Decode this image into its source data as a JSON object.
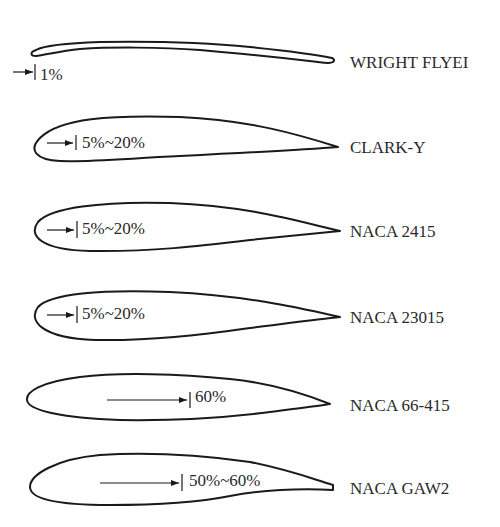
{
  "diagram": {
    "title": "",
    "airfoils": [
      {
        "name": "WRIGHT FLYEI",
        "max_thickness_position": "1%"
      },
      {
        "name": "CLARK-Y",
        "max_thickness_position": "5%~20%"
      },
      {
        "name": "NACA 2415",
        "max_thickness_position": "5%~20%"
      },
      {
        "name": "NACA 23015",
        "max_thickness_position": "5%~20%"
      },
      {
        "name": "NACA 66-415",
        "max_thickness_position": "60%"
      },
      {
        "name": "NACA GAW2",
        "max_thickness_position": "50%~60%"
      }
    ]
  }
}
